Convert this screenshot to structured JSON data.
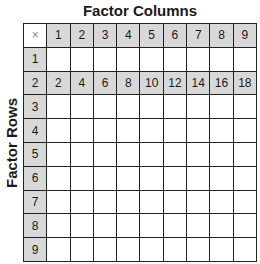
{
  "title": "Factor Columns",
  "row_axis_label": "Factor Rows",
  "corner_symbol": "×",
  "column_factors": [
    "1",
    "2",
    "3",
    "4",
    "5",
    "6",
    "7",
    "8",
    "9"
  ],
  "rows": [
    {
      "factor": "1",
      "products": [
        "",
        "",
        "",
        "",
        "",
        "",
        "",
        "",
        ""
      ]
    },
    {
      "factor": "2",
      "products": [
        "2",
        "4",
        "6",
        "8",
        "10",
        "12",
        "14",
        "16",
        "18"
      ]
    },
    {
      "factor": "3",
      "products": [
        "",
        "",
        "",
        "",
        "",
        "",
        "",
        "",
        ""
      ]
    },
    {
      "factor": "4",
      "products": [
        "",
        "",
        "",
        "",
        "",
        "",
        "",
        "",
        ""
      ]
    },
    {
      "factor": "5",
      "products": [
        "",
        "",
        "",
        "",
        "",
        "",
        "",
        "",
        ""
      ]
    },
    {
      "factor": "6",
      "products": [
        "",
        "",
        "",
        "",
        "",
        "",
        "",
        "",
        ""
      ]
    },
    {
      "factor": "7",
      "products": [
        "",
        "",
        "",
        "",
        "",
        "",
        "",
        "",
        ""
      ]
    },
    {
      "factor": "8",
      "products": [
        "",
        "",
        "",
        "",
        "",
        "",
        "",
        "",
        ""
      ]
    },
    {
      "factor": "9",
      "products": [
        "",
        "",
        "",
        "",
        "",
        "",
        "",
        "",
        ""
      ]
    }
  ],
  "colors": {
    "header_fill": "#d8d8d8",
    "grid_line": "#222222",
    "cell_fill": "#ffffff"
  }
}
